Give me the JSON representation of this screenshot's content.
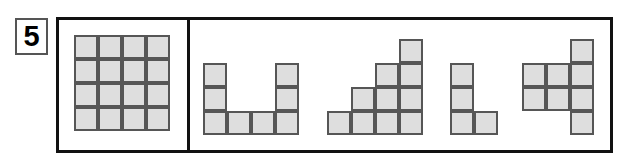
{
  "problem": {
    "number": "5",
    "number_box_border_color": "#555555"
  },
  "frame": {
    "border_color": "#111111",
    "divider_color": "#111111",
    "background_color": "#ffffff"
  },
  "style": {
    "cell_fill_color": "#dedede",
    "cell_border_color": "#565656",
    "cell_size_px": 24
  },
  "panels": {
    "reference": {
      "name": "reference-grid-panel",
      "description": "4 by 4 square grid of unit cells",
      "rows": 4,
      "cols": 4,
      "cell_count": 16,
      "origin": {
        "x": 74,
        "y": 35
      },
      "cells": [
        {
          "col": 0,
          "row": 0
        },
        {
          "col": 1,
          "row": 0
        },
        {
          "col": 2,
          "row": 0
        },
        {
          "col": 3,
          "row": 0
        },
        {
          "col": 0,
          "row": 1
        },
        {
          "col": 1,
          "row": 1
        },
        {
          "col": 2,
          "row": 1
        },
        {
          "col": 3,
          "row": 1
        },
        {
          "col": 0,
          "row": 2
        },
        {
          "col": 1,
          "row": 2
        },
        {
          "col": 2,
          "row": 2
        },
        {
          "col": 3,
          "row": 2
        },
        {
          "col": 0,
          "row": 3
        },
        {
          "col": 1,
          "row": 3
        },
        {
          "col": 2,
          "row": 3
        },
        {
          "col": 3,
          "row": 3
        }
      ]
    },
    "options": {
      "name": "answer-options-panel",
      "shapes": [
        {
          "id": "shape-u",
          "label": "U-shape",
          "cell_count": 8,
          "origin": {
            "x": 203,
            "y": 63
          },
          "cells": [
            {
              "col": 0,
              "row": 0
            },
            {
              "col": 3,
              "row": 0
            },
            {
              "col": 0,
              "row": 1
            },
            {
              "col": 3,
              "row": 1
            },
            {
              "col": 0,
              "row": 2
            },
            {
              "col": 1,
              "row": 2
            },
            {
              "col": 2,
              "row": 2
            },
            {
              "col": 3,
              "row": 2
            }
          ]
        },
        {
          "id": "shape-staircase",
          "label": "staircase-shape",
          "cell_count": 10,
          "origin": {
            "x": 327,
            "y": 39
          },
          "cells": [
            {
              "col": 3,
              "row": 0
            },
            {
              "col": 2,
              "row": 1
            },
            {
              "col": 3,
              "row": 1
            },
            {
              "col": 1,
              "row": 2
            },
            {
              "col": 2,
              "row": 2
            },
            {
              "col": 3,
              "row": 2
            },
            {
              "col": 0,
              "row": 3
            },
            {
              "col": 1,
              "row": 3
            },
            {
              "col": 2,
              "row": 3
            },
            {
              "col": 3,
              "row": 3
            }
          ]
        },
        {
          "id": "shape-l",
          "label": "L-shape",
          "cell_count": 4,
          "origin": {
            "x": 450,
            "y": 63
          },
          "cells": [
            {
              "col": 0,
              "row": 0
            },
            {
              "col": 0,
              "row": 1
            },
            {
              "col": 0,
              "row": 2
            },
            {
              "col": 1,
              "row": 2
            }
          ]
        },
        {
          "id": "shape-cross",
          "label": "cross-shape",
          "cell_count": 8,
          "origin": {
            "x": 522,
            "y": 39
          },
          "cells": [
            {
              "col": 2,
              "row": 0
            },
            {
              "col": 0,
              "row": 1
            },
            {
              "col": 1,
              "row": 1
            },
            {
              "col": 2,
              "row": 1
            },
            {
              "col": 0,
              "row": 2
            },
            {
              "col": 1,
              "row": 2
            },
            {
              "col": 2,
              "row": 2
            },
            {
              "col": 2,
              "row": 3
            }
          ]
        }
      ]
    }
  }
}
